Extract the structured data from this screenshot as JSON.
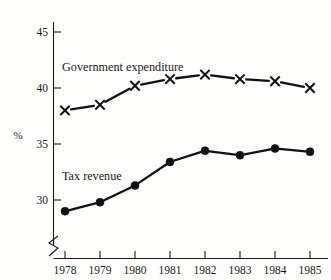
{
  "chart_data": {
    "type": "line",
    "title": "",
    "subtitle": "",
    "xlabel": "",
    "ylabel": "%",
    "categories": [
      "1978",
      "1979",
      "1980",
      "1981",
      "1982",
      "1983",
      "1984",
      "1985"
    ],
    "x": [
      1978,
      1979,
      1980,
      1981,
      1982,
      1983,
      1984,
      1985
    ],
    "ylim": [
      27.5,
      45.8
    ],
    "yticks": [
      30,
      35,
      40,
      45
    ],
    "ytick_labels": [
      "30",
      "35",
      "40",
      "45"
    ],
    "xtick_labels": [
      "1978",
      "1979",
      "1980",
      "1981",
      "1982",
      "1983",
      "1984",
      "1985"
    ],
    "grid": false,
    "legend_position": "inline-annotation",
    "axis_break": true,
    "axis_break_note": "zig-zag break on y-axis below 30",
    "series": [
      {
        "name": "Government expenditure",
        "marker": "x-cross",
        "values": [
          38.0,
          38.5,
          40.2,
          40.8,
          41.2,
          40.8,
          40.6,
          40.0
        ]
      },
      {
        "name": "Tax revenue",
        "marker": "filled-circle",
        "values": [
          29.0,
          29.8,
          31.3,
          33.4,
          34.4,
          34.0,
          34.6,
          34.3
        ]
      }
    ],
    "annotations": [
      {
        "text": "Government expenditure",
        "x": 1978.3,
        "y": 42.8
      },
      {
        "text": "Tax revenue",
        "x": 1978.1,
        "y": 31.8
      }
    ],
    "colors": {
      "line": "#111111",
      "axis": "#1a1a1a",
      "background": "#fdfdfb"
    }
  },
  "labels": {
    "y_axis_title": "%",
    "series_government": "Government expenditure",
    "series_tax": "Tax revenue",
    "y_45": "45",
    "y_40": "40",
    "y_35": "35",
    "y_30": "30",
    "x_1978": "1978",
    "x_1979": "1979",
    "x_1980": "1980",
    "x_1981": "1981",
    "x_1982": "1982",
    "x_1983": "1983",
    "x_1984": "1984",
    "x_1985": "1985"
  }
}
